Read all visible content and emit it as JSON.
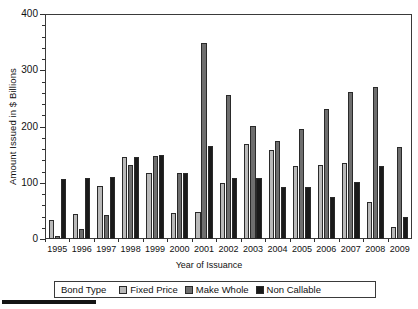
{
  "chart_data": {
    "type": "bar",
    "title": "",
    "xlabel": "Year of Issuance",
    "ylabel": "Amount Issued in $ Billions",
    "ylim": [
      0,
      400
    ],
    "ytick_step": 100,
    "yminor_step": 20,
    "grid": false,
    "legend_position": "bottom",
    "legend_title": "Bond Type",
    "categories": [
      "1995",
      "1996",
      "1997",
      "1998",
      "1999",
      "2000",
      "2001",
      "2002",
      "2003",
      "2004",
      "2005",
      "2006",
      "2007",
      "2008",
      "2009"
    ],
    "series": [
      {
        "name": "Fixed Price",
        "color": "#b9b9b9",
        "values": [
          33,
          45,
          95,
          145,
          117,
          46,
          48,
          100,
          169,
          158,
          130,
          132,
          135,
          66,
          22
        ]
      },
      {
        "name": "Make Whole",
        "color": "#6e6e6e",
        "values": [
          5,
          17,
          42,
          132,
          148,
          118,
          348,
          256,
          201,
          175,
          196,
          231,
          261,
          271,
          163
        ]
      },
      {
        "name": "Non Callable",
        "color": "#1a1a1a",
        "values": [
          107,
          109,
          110,
          145,
          150,
          118,
          165,
          108,
          108,
          93,
          92,
          75,
          101,
          130,
          40
        ]
      }
    ]
  },
  "yticks": [
    "0",
    "100",
    "200",
    "300",
    "400"
  ],
  "legend": {
    "title": "Bond Type",
    "items": [
      {
        "label": "Fixed Price"
      },
      {
        "label": "Make Whole"
      },
      {
        "label": "Non Callable"
      }
    ]
  },
  "axis": {
    "x_title": "Year of Issuance",
    "y_title": "Amount Issued in $ Billions"
  }
}
